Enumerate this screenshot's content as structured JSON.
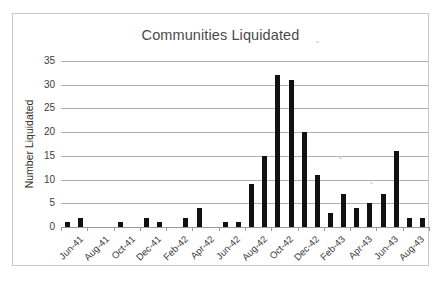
{
  "chart_data": {
    "type": "bar",
    "title": "Communities Liquidated",
    "xlabel": "",
    "ylabel": "Number Liquidated",
    "ylim": [
      0,
      35
    ],
    "ytick_step": 5,
    "yticks": [
      "0",
      "5",
      "10",
      "15",
      "20",
      "25",
      "30",
      "35"
    ],
    "grid": true,
    "legend": "none",
    "bar_color": "#111111",
    "gridline_color": "#b0b0b0",
    "categories": [
      "Jun-41",
      "Jul-41",
      "Aug-41",
      "Sep-41",
      "Oct-41",
      "Nov-41",
      "Dec-41",
      "Jan-42",
      "Feb-42",
      "Mar-42",
      "Apr-42",
      "May-42",
      "Jun-42",
      "Jul-42",
      "Aug-42",
      "Sep-42",
      "Oct-42",
      "Nov-42",
      "Dec-42",
      "Jan-43",
      "Feb-43",
      "Mar-43",
      "Apr-43",
      "May-43",
      "Jun-43",
      "Jul-43",
      "Aug-43",
      "Sep-43"
    ],
    "values": [
      1,
      2,
      0,
      0,
      1,
      0,
      2,
      1,
      0,
      2,
      4,
      0,
      1,
      1,
      9,
      15,
      32,
      31,
      20,
      11,
      3,
      7,
      4,
      5,
      7,
      16,
      2,
      2
    ],
    "tick_labels": [
      "Jun-41",
      "Aug-41",
      "Oct-41",
      "Dec-41",
      "Feb-42",
      "Apr-42",
      "Jun-42",
      "Aug-42",
      "Oct-42",
      "Dec-42",
      "Feb-43",
      "Apr-43",
      "Jun-43",
      "Aug-43"
    ],
    "tick_label_indices": [
      0,
      2,
      4,
      6,
      8,
      10,
      12,
      14,
      16,
      18,
      20,
      22,
      24,
      26
    ]
  }
}
